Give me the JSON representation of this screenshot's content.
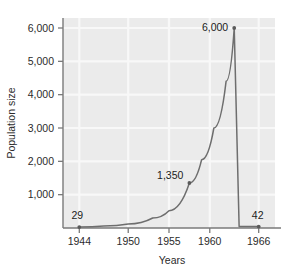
{
  "chart_data": {
    "type": "line",
    "title": "",
    "xlabel": "Years",
    "ylabel": "Population size",
    "xlim": [
      1942,
      1968
    ],
    "ylim": [
      0,
      6300
    ],
    "grid": true,
    "legend": "none",
    "x_ticks": [
      "1944",
      "1950",
      "1955",
      "1960",
      "1966"
    ],
    "x_tick_values": [
      1944,
      1950,
      1955,
      1960,
      1966
    ],
    "y_ticks": [
      "1,000",
      "2,000",
      "3,000",
      "4,000",
      "5,000",
      "6,000"
    ],
    "y_tick_values": [
      1000,
      2000,
      3000,
      4000,
      5000,
      6000
    ],
    "x": [
      1944,
      1947,
      1950,
      1953,
      1955,
      1957.5,
      1959,
      1960.5,
      1962,
      1963,
      1963.6,
      1966
    ],
    "values": [
      29,
      60,
      120,
      300,
      520,
      1350,
      2050,
      3000,
      4400,
      6000,
      42,
      42
    ],
    "annotations": [
      {
        "label": "29",
        "x": 1944,
        "y": 29
      },
      {
        "label": "1,350",
        "x": 1957.5,
        "y": 1350
      },
      {
        "label": "6,000",
        "x": 1963,
        "y": 6000
      },
      {
        "label": "42",
        "x": 1966,
        "y": 42
      }
    ],
    "markers": [
      {
        "x": 1944,
        "y": 29
      },
      {
        "x": 1957.5,
        "y": 1350
      },
      {
        "x": 1963,
        "y": 6000
      },
      {
        "x": 1966,
        "y": 42
      }
    ],
    "colors": {
      "line": "#6e6e6e",
      "marker": "#5a5a5a",
      "plot_background": "#ebebeb",
      "gridline": "#f7f7f7",
      "axis": "#7a7a7a",
      "text": "#2b2b2b"
    }
  }
}
